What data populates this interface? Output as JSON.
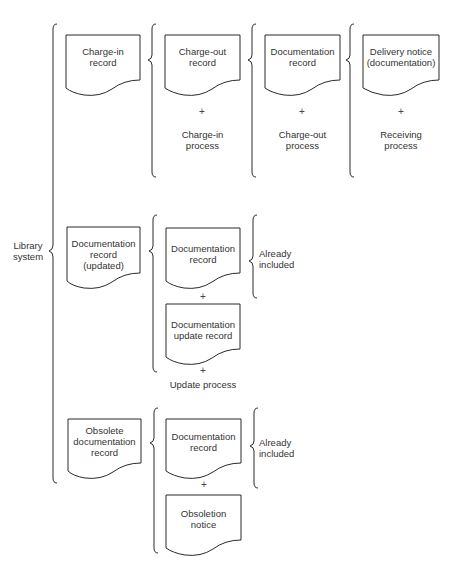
{
  "diagram": {
    "root": {
      "label": "Library system"
    },
    "rows": [
      {
        "primary": {
          "label": "Charge-in record",
          "lines": [
            "Charge-in",
            "record"
          ]
        },
        "columns": [
          {
            "doc": {
              "lines": [
                "Charge-out",
                "record"
              ]
            },
            "plus": "+",
            "process": {
              "lines": [
                "Charge-in",
                "process"
              ]
            }
          },
          {
            "doc": {
              "lines": [
                "Documentation",
                "record"
              ]
            },
            "plus": "+",
            "process": {
              "lines": [
                "Charge-out",
                "process"
              ]
            }
          },
          {
            "doc": {
              "lines": [
                "Delivery notice",
                "(documentation)"
              ]
            },
            "plus": "+",
            "process": {
              "lines": [
                "Receiving",
                "process"
              ]
            }
          }
        ]
      },
      {
        "primary": {
          "label": "Documentation record (updated)",
          "lines": [
            "Documentation",
            "record",
            "(updated)"
          ]
        },
        "components": [
          {
            "doc": {
              "lines": [
                "Documentation",
                "record"
              ]
            },
            "plus": "+"
          },
          {
            "doc": {
              "lines": [
                "Documentation",
                "update record"
              ]
            },
            "plus": "+"
          }
        ],
        "process": "Update process",
        "note": {
          "lines": [
            "Already",
            "included"
          ]
        }
      },
      {
        "primary": {
          "label": "Obsolete documentation record",
          "lines": [
            "Obsolete",
            "documentation",
            "record"
          ]
        },
        "components": [
          {
            "doc": {
              "lines": [
                "Documentation",
                "record"
              ]
            },
            "plus": "+"
          },
          {
            "doc": {
              "lines": [
                "Obsoletion",
                "notice"
              ]
            }
          }
        ],
        "note": {
          "lines": [
            "Already",
            "included"
          ]
        }
      }
    ]
  },
  "colors": {
    "line": "#2a2a2a",
    "background": "#ffffff"
  }
}
